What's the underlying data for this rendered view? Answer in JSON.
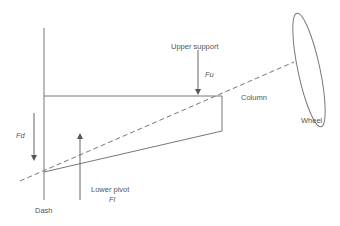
{
  "diagram": {
    "labels": {
      "upper_support": "Upper support",
      "fu": "Fu",
      "column": "Column",
      "wheel": "Wheel",
      "fd": "Fd",
      "lower_pivot": "Lower pivot",
      "fl": "Fl",
      "dash": "Dash"
    },
    "colors": {
      "stroke": "#777777",
      "text": "#555555",
      "background": "#ffffff"
    }
  }
}
